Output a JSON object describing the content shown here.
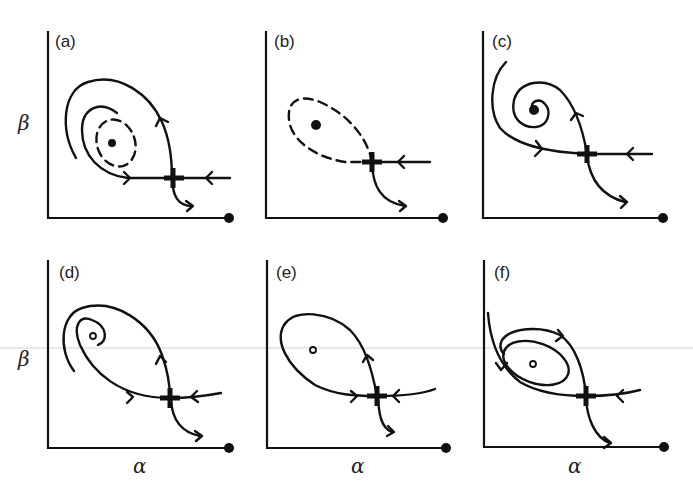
{
  "figure": {
    "axis_labels": {
      "y": "β",
      "x": "α"
    },
    "panels": [
      {
        "id": "a",
        "label": "(a)",
        "interior_equilibrium": "stable (filled) with dashed unstable limit cycle",
        "show_beta": true,
        "show_alpha": false
      },
      {
        "id": "b",
        "label": "(b)",
        "interior_equilibrium": "stable (filled) with dashed homoclinic orbit",
        "show_beta": false,
        "show_alpha": false
      },
      {
        "id": "c",
        "label": "(c)",
        "interior_equilibrium": "stable spiral (filled)",
        "show_beta": false,
        "show_alpha": false
      },
      {
        "id": "d",
        "label": "(d)",
        "interior_equilibrium": "unstable spiral (open)",
        "show_beta": true,
        "show_alpha": true
      },
      {
        "id": "e",
        "label": "(e)",
        "interior_equilibrium": "unstable (open) with homoclinic loop",
        "show_beta": false,
        "show_alpha": true
      },
      {
        "id": "f",
        "label": "(f)",
        "interior_equilibrium": "unstable (open) with stable limit cycle",
        "show_beta": false,
        "show_alpha": true
      }
    ],
    "features": {
      "saddle": "cross marker at trajectory intersection",
      "boundary_equilibrium": "filled dot at end of alpha axis"
    }
  }
}
